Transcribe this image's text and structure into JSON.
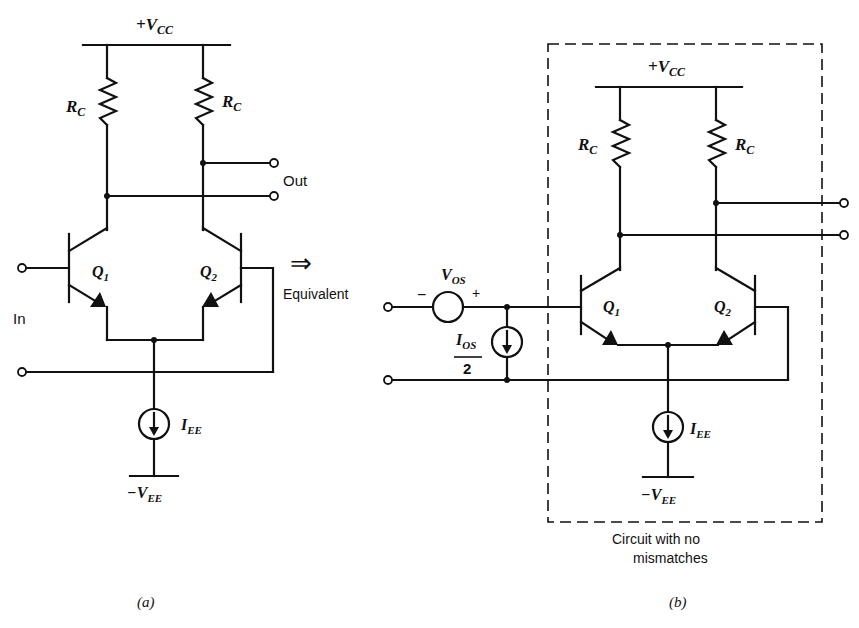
{
  "figure": {
    "panel_a": {
      "caption": "(a)",
      "supply_pos": {
        "main": "+V",
        "sub": "CC"
      },
      "resistor_left": {
        "main": "R",
        "sub": "C"
      },
      "resistor_right": {
        "main": "R",
        "sub": "C"
      },
      "transistor_left": {
        "main": "Q",
        "sub": "1"
      },
      "transistor_right": {
        "main": "Q",
        "sub": "2"
      },
      "current_source": {
        "main": "I",
        "sub": "EE"
      },
      "supply_neg": {
        "main": "−V",
        "sub": "EE"
      },
      "input_label": "In",
      "output_label": "Out"
    },
    "arrow": {
      "symbol": "⇒",
      "label": "Equivalent"
    },
    "panel_b": {
      "caption": "(b)",
      "supply_pos": {
        "main": "+V",
        "sub": "CC"
      },
      "resistor_left": {
        "main": "R",
        "sub": "C"
      },
      "resistor_right": {
        "main": "R",
        "sub": "C"
      },
      "transistor_left": {
        "main": "Q",
        "sub": "1"
      },
      "transistor_right": {
        "main": "Q",
        "sub": "2"
      },
      "current_source": {
        "main": "I",
        "sub": "EE"
      },
      "supply_neg": {
        "main": "−V",
        "sub": "EE"
      },
      "offset_voltage": {
        "main": "V",
        "sub": "OS",
        "minus": "−",
        "plus": "+"
      },
      "offset_current": {
        "numerator_main": "I",
        "numerator_sub": "OS",
        "denominator": "2"
      },
      "box_caption_line1": "Circuit with no",
      "box_caption_line2": "mismatches"
    }
  }
}
